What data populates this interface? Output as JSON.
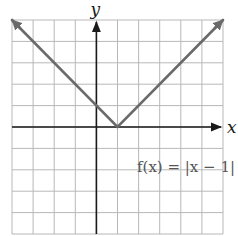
{
  "chart_data": {
    "type": "line",
    "title": "",
    "function_label": "f(x) = |x − 1|",
    "xlabel": "x",
    "ylabel": "y",
    "xlim": [
      -4,
      6
    ],
    "ylim": [
      -5,
      5
    ],
    "grid": true,
    "grid_step": 1,
    "tick_labels": false,
    "legend": "none",
    "series": [
      {
        "name": "f(x) = |x − 1|",
        "x": [
          -4,
          1,
          6
        ],
        "y": [
          5,
          0,
          5
        ],
        "arrows_at_ends": true,
        "color": "#6a6a6a"
      }
    ],
    "vertex": {
      "x": 1,
      "y": 0
    }
  },
  "labels": {
    "x_axis": "x",
    "y_axis": "y",
    "function": "f(x) = |x − 1|"
  },
  "colors": {
    "grid": "#b8b8b8",
    "axis": "#1a1a1a",
    "curve": "#6a6a6a",
    "function_label": "#555555"
  }
}
